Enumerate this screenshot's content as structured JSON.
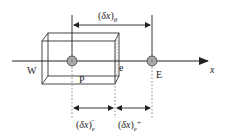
{
  "diagram": {
    "nodes": {
      "west": {
        "label": "W"
      },
      "center": {
        "label": "P"
      },
      "east": {
        "label": "E"
      },
      "face": {
        "label": "e"
      }
    },
    "axis": {
      "label": "x"
    },
    "dimensions": {
      "top": {
        "open": "(",
        "var": "δx",
        "close": ")",
        "sub": "θ"
      },
      "bottom_left": {
        "open": "(",
        "var": "δx",
        "close": ")",
        "sub": "e",
        "sup": "−"
      },
      "bottom_right": {
        "open": "(",
        "var": "δx",
        "close": ")",
        "sub": "e",
        "sup": "+"
      }
    },
    "colors": {
      "line": "#222222",
      "node_fill": "#a8a8a8",
      "node_stroke": "#555555",
      "dotted": "#888888"
    }
  }
}
